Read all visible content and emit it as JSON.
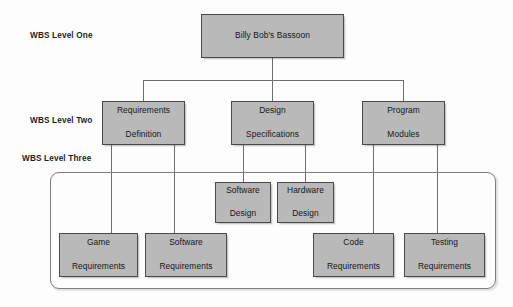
{
  "diagram": {
    "type": "wbs-tree",
    "background_color": "#fdfdfd",
    "box_fill_color": "#b9b9b9",
    "box_border_color": "#4a4a4a",
    "connector_color": "#6f6f6f"
  },
  "level_labels": [
    {
      "text": "WBS Level One"
    },
    {
      "text": "WBS Level Two"
    },
    {
      "text": "WBS Level Three"
    }
  ],
  "nodes": {
    "root": {
      "label": "Billy Bob's Bassoon",
      "level": 1
    },
    "level_two": [
      {
        "label_line1": "Requirements",
        "label_line2": "Definition"
      },
      {
        "label_line1": "Design",
        "label_line2": "Specifications"
      },
      {
        "label_line1": "Program",
        "label_line2": "Modules"
      }
    ],
    "level_three_middle": [
      {
        "label_line1": "Software",
        "label_line2": "Design"
      },
      {
        "label_line1": "Hardware",
        "label_line2": "Design"
      }
    ],
    "level_three_bottom": [
      {
        "label_line1": "Game",
        "label_line2": "Requirements"
      },
      {
        "label_line1": "Software",
        "label_line2": "Requirements"
      },
      {
        "label_line1": "Code",
        "label_line2": "Requirements"
      },
      {
        "label_line1": "Testing",
        "label_line2": "Requirements"
      }
    ]
  }
}
